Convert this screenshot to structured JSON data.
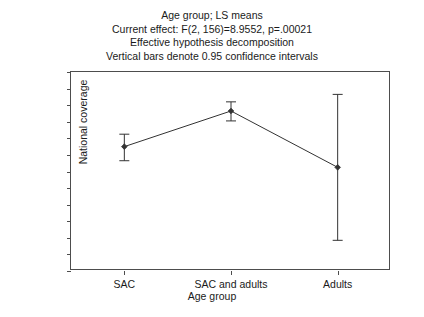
{
  "chart_data": {
    "type": "line",
    "title": "Age group; LS means",
    "title_lines": [
      "Age group; LS means",
      "Current effect: F(2, 156)=8.9552, p=.00021",
      "Effective hypothesis decomposition",
      "Vertical bars denote 0.95 confidence intervals"
    ],
    "xlabel": "Age group",
    "ylabel": "National coverage",
    "categories": [
      "SAC",
      "SAC and adults",
      "Adults"
    ],
    "values": [
      0.15,
      0.365,
      0.025
    ],
    "ci_lower": [
      0.065,
      0.305,
      -0.415
    ],
    "ci_upper": [
      0.225,
      0.42,
      0.465
    ],
    "ylim": [
      -0.6,
      0.6
    ],
    "ytick_labels": [
      "0.6",
      "0.5",
      "0.4",
      "0.3",
      "0.2",
      "0.1",
      "0.0",
      "-0.1",
      "-0.2",
      "-0.3",
      "-0.4",
      "-0.5",
      "-0.6"
    ],
    "ytick_values": [
      0.6,
      0.5,
      0.4,
      0.3,
      0.2,
      0.1,
      0.0,
      -0.1,
      -0.2,
      -0.3,
      -0.4,
      -0.5,
      -0.6
    ],
    "grid": false,
    "legend": "none",
    "series_color": "#333333",
    "axis_color": "#4d4d4d",
    "marker": "filled-diamond",
    "error_bars": "0.95 confidence intervals"
  }
}
